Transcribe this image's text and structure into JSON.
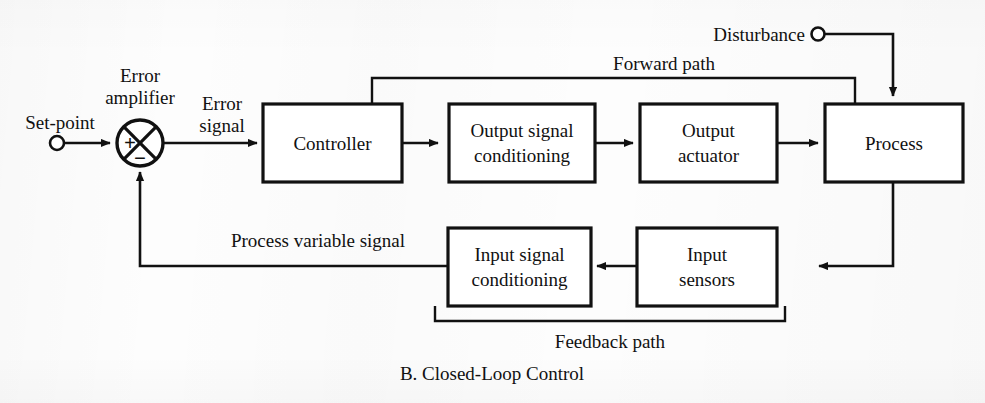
{
  "figure": {
    "caption": "B. Closed-Loop Control",
    "diagram_type": "block-diagram"
  },
  "blocks": [
    {
      "id": "controller",
      "label_line1": "Controller",
      "label_line2": ""
    },
    {
      "id": "output-signal-conditioning",
      "label_line1": "Output signal",
      "label_line2": "conditioning"
    },
    {
      "id": "output-actuator",
      "label_line1": "Output",
      "label_line2": "actuator"
    },
    {
      "id": "process",
      "label_line1": "Process",
      "label_line2": ""
    },
    {
      "id": "input-signal-conditioning",
      "label_line1": "Input signal",
      "label_line2": "conditioning"
    },
    {
      "id": "input-sensors",
      "label_line1": "Input",
      "label_line2": "sensors"
    }
  ],
  "labels": {
    "set_point": "Set-point",
    "error_amplifier_line1": "Error",
    "error_amplifier_line2": "amplifier",
    "error_signal_line1": "Error",
    "error_signal_line2": "signal",
    "disturbance": "Disturbance",
    "forward_path": "Forward path",
    "feedback_path": "Feedback path",
    "process_variable_signal": "Process variable signal",
    "sum_plus": "+",
    "sum_minus": "−"
  },
  "colors": {
    "ink": "#111111",
    "paper": "#fdfdfd",
    "box_fill": "#ffffff"
  }
}
